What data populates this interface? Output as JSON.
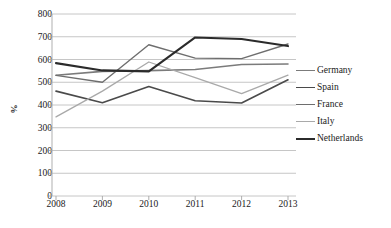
{
  "chart_data": {
    "type": "line",
    "title": "",
    "xlabel": "",
    "ylabel": "%",
    "categories": [
      "2008",
      "2009",
      "2010",
      "2011",
      "2012",
      "2013"
    ],
    "x": [
      2008,
      2009,
      2010,
      2011,
      2012,
      2013
    ],
    "ylim": [
      0,
      800
    ],
    "ytick_step": 100,
    "yticks": [
      800,
      700,
      600,
      500,
      400,
      300,
      200,
      100,
      0
    ],
    "ytick_labels": [
      "800",
      "700",
      "600",
      "500",
      "400",
      "300",
      "200",
      "100",
      "0"
    ],
    "grid": true,
    "grid_axis": "y",
    "legend_position": "right",
    "series": [
      {
        "name": "Germany",
        "color": "#7b7b7b",
        "width": 1.6,
        "values": [
          531,
          548,
          551,
          556,
          578,
          580
        ]
      },
      {
        "name": "Spain",
        "color": "#4a4a4a",
        "width": 1.6,
        "values": [
          461,
          410,
          481,
          419,
          409,
          511
        ]
      },
      {
        "name": "France",
        "color": "#6e6e6e",
        "width": 1.4,
        "values": [
          530,
          500,
          665,
          606,
          604,
          668
        ]
      },
      {
        "name": "Italy",
        "color": "#a9a9a9",
        "width": 1.3,
        "values": [
          348,
          461,
          589,
          520,
          450,
          531
        ]
      },
      {
        "name": "Netherlands",
        "color": "#2b2b2b",
        "width": 2.1,
        "values": [
          584,
          552,
          548,
          697,
          690,
          659
        ]
      }
    ]
  },
  "axes": {
    "y_title": "%",
    "y_tick_labels": [
      "800",
      "700",
      "600",
      "500",
      "400",
      "300",
      "200",
      "100",
      "0"
    ],
    "x_tick_labels": [
      "2008",
      "2009",
      "2010",
      "2011",
      "2012",
      "2013"
    ]
  },
  "legend": {
    "items": [
      {
        "label": "Germany"
      },
      {
        "label": "Spain"
      },
      {
        "label": "France"
      },
      {
        "label": "Italy"
      },
      {
        "label": "Netherlands"
      }
    ]
  },
  "style": {
    "grid_color": "#b8b8b8",
    "axis_color": "#a6a6a6",
    "text_color": "#1a1a1a",
    "background": "#ffffff"
  }
}
